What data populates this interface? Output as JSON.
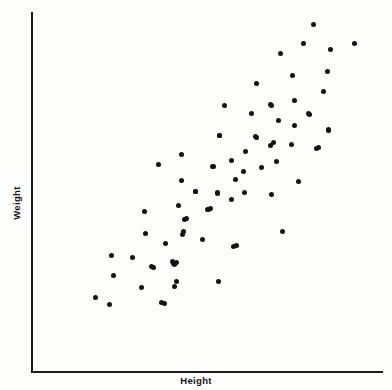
{
  "chart_data": {
    "type": "scatter",
    "title": "",
    "subtitle": "",
    "xlabel": "Height",
    "ylabel": "Weight",
    "grid": false,
    "legend": null,
    "annotations": [],
    "marker": {
      "shape": "circle",
      "color": "#111111",
      "size_px": 5
    },
    "axis_color": "#1b1b1b",
    "background_color": "#fdfdfc",
    "xlim": [
      0,
      100
    ],
    "ylim": [
      0,
      100
    ],
    "axis_pixel_frame": {
      "x0": 32,
      "x1": 383,
      "y0": 12,
      "y1": 372
    },
    "point_count": 72,
    "points_px": [
      [
        95,
        297
      ],
      [
        109,
        304
      ],
      [
        111,
        255
      ],
      [
        113,
        275
      ],
      [
        132,
        257
      ],
      [
        141,
        287
      ],
      [
        144,
        211
      ],
      [
        145,
        233
      ],
      [
        151,
        266
      ],
      [
        153,
        267
      ],
      [
        158,
        164
      ],
      [
        161,
        302
      ],
      [
        164,
        303
      ],
      [
        165,
        243
      ],
      [
        172,
        261
      ],
      [
        173,
        263
      ],
      [
        174,
        264
      ],
      [
        174,
        286
      ],
      [
        176,
        262
      ],
      [
        176,
        281
      ],
      [
        178,
        205
      ],
      [
        181,
        154
      ],
      [
        181,
        180
      ],
      [
        182,
        234
      ],
      [
        183,
        231
      ],
      [
        184,
        219
      ],
      [
        186,
        218
      ],
      [
        195,
        191
      ],
      [
        195,
        191
      ],
      [
        202,
        239
      ],
      [
        207,
        209
      ],
      [
        208,
        209
      ],
      [
        210,
        208
      ],
      [
        212,
        166
      ],
      [
        213,
        166
      ],
      [
        217,
        193
      ],
      [
        217,
        192
      ],
      [
        218,
        281
      ],
      [
        219,
        135
      ],
      [
        219,
        135
      ],
      [
        224,
        105
      ],
      [
        231,
        160
      ],
      [
        231,
        199
      ],
      [
        233,
        246
      ],
      [
        235,
        179
      ],
      [
        236,
        245
      ],
      [
        243,
        171
      ],
      [
        244,
        192
      ],
      [
        245,
        151
      ],
      [
        251,
        113
      ],
      [
        255,
        136
      ],
      [
        256,
        83
      ],
      [
        256,
        137
      ],
      [
        261,
        167
      ],
      [
        270,
        145
      ],
      [
        270,
        104
      ],
      [
        271,
        194
      ],
      [
        271,
        105
      ],
      [
        273,
        142
      ],
      [
        276,
        161
      ],
      [
        278,
        120
      ],
      [
        280,
        53
      ],
      [
        282,
        231
      ],
      [
        291,
        144
      ],
      [
        292,
        75
      ],
      [
        294,
        100
      ],
      [
        294,
        125
      ],
      [
        298,
        181
      ],
      [
        303,
        43
      ],
      [
        308,
        113
      ],
      [
        309,
        114
      ],
      [
        313,
        24
      ],
      [
        316,
        148
      ],
      [
        318,
        147
      ],
      [
        323,
        91
      ],
      [
        327,
        71
      ],
      [
        328,
        129
      ],
      [
        328,
        130
      ],
      [
        330,
        49
      ],
      [
        354,
        43
      ]
    ],
    "points_data": [
      {
        "x": 17.9,
        "y": 20.8
      },
      {
        "x": 21.9,
        "y": 18.9
      },
      {
        "x": 22.5,
        "y": 32.5
      },
      {
        "x": 23.1,
        "y": 26.9
      },
      {
        "x": 28.5,
        "y": 31.9
      },
      {
        "x": 31.1,
        "y": 23.6
      },
      {
        "x": 31.9,
        "y": 44.7
      },
      {
        "x": 32.2,
        "y": 38.6
      },
      {
        "x": 33.9,
        "y": 29.4
      },
      {
        "x": 34.5,
        "y": 29.2
      },
      {
        "x": 35.9,
        "y": 57.8
      },
      {
        "x": 36.8,
        "y": 19.4
      },
      {
        "x": 37.6,
        "y": 19.2
      },
      {
        "x": 37.9,
        "y": 35.8
      },
      {
        "x": 39.9,
        "y": 30.8
      },
      {
        "x": 40.2,
        "y": 30.3
      },
      {
        "x": 40.5,
        "y": 30.0
      },
      {
        "x": 40.5,
        "y": 23.9
      },
      {
        "x": 41.0,
        "y": 30.6
      },
      {
        "x": 41.0,
        "y": 25.3
      },
      {
        "x": 41.6,
        "y": 46.4
      },
      {
        "x": 42.5,
        "y": 60.6
      },
      {
        "x": 42.5,
        "y": 53.3
      },
      {
        "x": 42.7,
        "y": 38.3
      },
      {
        "x": 43.0,
        "y": 39.2
      },
      {
        "x": 43.3,
        "y": 42.5
      },
      {
        "x": 43.9,
        "y": 42.8
      },
      {
        "x": 46.4,
        "y": 50.3
      },
      {
        "x": 46.4,
        "y": 50.3
      },
      {
        "x": 48.4,
        "y": 36.9
      },
      {
        "x": 49.9,
        "y": 45.3
      },
      {
        "x": 50.1,
        "y": 45.3
      },
      {
        "x": 50.7,
        "y": 45.6
      },
      {
        "x": 51.3,
        "y": 57.2
      },
      {
        "x": 51.6,
        "y": 57.2
      },
      {
        "x": 52.7,
        "y": 49.7
      },
      {
        "x": 52.7,
        "y": 50.0
      },
      {
        "x": 53.0,
        "y": 25.3
      },
      {
        "x": 53.3,
        "y": 65.8
      },
      {
        "x": 53.3,
        "y": 65.8
      },
      {
        "x": 54.7,
        "y": 74.2
      },
      {
        "x": 56.7,
        "y": 58.9
      },
      {
        "x": 56.7,
        "y": 48.1
      },
      {
        "x": 57.3,
        "y": 35.0
      },
      {
        "x": 57.8,
        "y": 53.6
      },
      {
        "x": 58.1,
        "y": 35.3
      },
      {
        "x": 60.1,
        "y": 55.8
      },
      {
        "x": 60.4,
        "y": 50.0
      },
      {
        "x": 60.7,
        "y": 61.4
      },
      {
        "x": 62.4,
        "y": 71.9
      },
      {
        "x": 63.5,
        "y": 65.6
      },
      {
        "x": 63.8,
        "y": 80.3
      },
      {
        "x": 63.8,
        "y": 65.3
      },
      {
        "x": 65.2,
        "y": 56.9
      },
      {
        "x": 67.8,
        "y": 63.1
      },
      {
        "x": 67.8,
        "y": 74.4
      },
      {
        "x": 68.1,
        "y": 49.4
      },
      {
        "x": 68.1,
        "y": 74.2
      },
      {
        "x": 68.7,
        "y": 63.9
      },
      {
        "x": 69.5,
        "y": 58.6
      },
      {
        "x": 70.1,
        "y": 70.0
      },
      {
        "x": 70.7,
        "y": 88.6
      },
      {
        "x": 71.2,
        "y": 39.2
      },
      {
        "x": 73.8,
        "y": 63.3
      },
      {
        "x": 74.1,
        "y": 82.5
      },
      {
        "x": 74.6,
        "y": 75.6
      },
      {
        "x": 74.6,
        "y": 68.6
      },
      {
        "x": 75.8,
        "y": 53.1
      },
      {
        "x": 77.2,
        "y": 91.4
      },
      {
        "x": 78.6,
        "y": 71.9
      },
      {
        "x": 78.9,
        "y": 71.7
      },
      {
        "x": 80.1,
        "y": 96.7
      },
      {
        "x": 80.9,
        "y": 62.2
      },
      {
        "x": 81.5,
        "y": 62.5
      },
      {
        "x": 82.9,
        "y": 78.1
      },
      {
        "x": 84.0,
        "y": 83.6
      },
      {
        "x": 84.3,
        "y": 67.5
      },
      {
        "x": 84.3,
        "y": 67.2
      },
      {
        "x": 84.9,
        "y": 89.7
      },
      {
        "x": 91.7,
        "y": 91.4
      }
    ]
  }
}
